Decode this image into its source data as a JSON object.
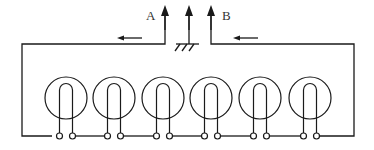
{
  "diagram": {
    "type": "circuit-schematic",
    "labels": {
      "terminal_a": "A",
      "terminal_b": "B"
    },
    "terminals": [
      {
        "id": "A",
        "x": 165,
        "label": "A",
        "icon": "arrow-up"
      },
      {
        "id": "ground",
        "x": 189,
        "label": "",
        "icon": "ground-symbol"
      },
      {
        "id": "B",
        "x": 211,
        "label": "B",
        "icon": "arrow-up"
      }
    ],
    "current_arrows": [
      {
        "id": "left",
        "direction": "left",
        "x1": 142,
        "x2": 117,
        "y": 38
      },
      {
        "id": "right",
        "direction": "left",
        "x1": 258,
        "x2": 233,
        "y": 38
      }
    ],
    "coils": [
      {
        "index": 1,
        "cx": 66,
        "cy": 98,
        "r": 21
      },
      {
        "index": 2,
        "cx": 114,
        "cy": 98,
        "r": 21
      },
      {
        "index": 3,
        "cx": 163,
        "cy": 98,
        "r": 21
      },
      {
        "index": 4,
        "cx": 211,
        "cy": 98,
        "r": 21
      },
      {
        "index": 5,
        "cx": 260,
        "cy": 98,
        "r": 21
      },
      {
        "index": 6,
        "cx": 310,
        "cy": 98,
        "r": 21
      }
    ],
    "coil_count": 6,
    "colors": {
      "line": "#1a1a1a",
      "label": "#333333",
      "background": "#ffffff"
    }
  }
}
